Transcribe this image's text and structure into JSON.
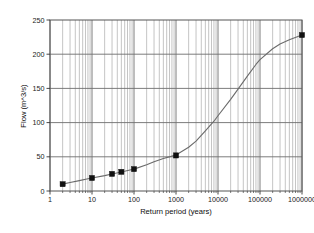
{
  "chart_data": {
    "type": "line",
    "title": "",
    "subtitle": "",
    "xlabel": "Return period (years)",
    "ylabel": "Flow (m^3/s)",
    "xscale": "log",
    "yscale": "linear",
    "xlim": [
      1,
      1000000
    ],
    "ylim": [
      0,
      250
    ],
    "grid": true,
    "grid_minor_x": true,
    "legend": "none",
    "x_tick_labels": [
      "1",
      "10",
      "100",
      "1000",
      "10000",
      "100000",
      "1000000"
    ],
    "x_ticks": [
      1,
      10,
      100,
      1000,
      10000,
      100000,
      1000000
    ],
    "y_tick_labels": [
      "0",
      "50",
      "100",
      "150",
      "200",
      "250"
    ],
    "y_ticks": [
      0,
      50,
      100,
      150,
      200,
      250
    ],
    "series": [
      {
        "name": "Flow frequency curve",
        "type": "line",
        "marker": "none",
        "color": "#6b6b6b",
        "x": [
          2,
          3,
          5,
          8,
          10,
          20,
          30,
          50,
          80,
          100,
          200,
          300,
          500,
          800,
          1000,
          2000,
          3000,
          5000,
          8000,
          10000,
          20000,
          30000,
          50000,
          80000,
          100000,
          200000,
          300000,
          500000,
          800000,
          1000000
        ],
        "y": [
          10,
          12.5,
          15.2,
          17.8,
          19,
          22.5,
          24.8,
          27.8,
          30.6,
          32,
          38.5,
          42.8,
          47.5,
          51,
          52.5,
          64,
          73,
          88,
          102,
          110,
          134,
          149,
          168,
          185,
          192,
          208,
          215,
          221,
          226,
          228
        ]
      },
      {
        "name": "Observed / derived data points",
        "type": "scatter",
        "marker": "square",
        "color": "#111111",
        "x": [
          2,
          10,
          30,
          50,
          100,
          1000,
          1000000
        ],
        "y": [
          10,
          19,
          25,
          28,
          32,
          52,
          228
        ]
      }
    ]
  },
  "axes": {
    "frame_color": "#555555",
    "major_grid_color": "#6e6e6e",
    "minor_grid_color": "#aaaaaa"
  }
}
